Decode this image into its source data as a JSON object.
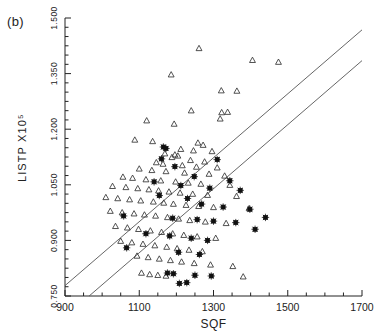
{
  "figure": {
    "panel_label": "(b)"
  },
  "chart_data": {
    "type": "scatter",
    "title": "",
    "xlabel": "SQF",
    "ylabel": "LISTP X10⁵",
    "xlim": [
      900,
      1700
    ],
    "ylim": [
      0.75,
      1.5
    ],
    "xticks": [
      900,
      1100,
      1300,
      1500,
      1700
    ],
    "xtick_labels": [
      "900",
      "1100",
      "1300",
      "1500",
      "1700"
    ],
    "xtick_minor_step": 50,
    "yticks": [
      0.75,
      0.9,
      1.05,
      1.2,
      1.35,
      1.5
    ],
    "ytick_labels": [
      "0.750",
      "0.900",
      "1.050",
      "1.200",
      "1.350",
      "1.500"
    ],
    "ytick_minor_step": 0.025,
    "grid": false,
    "legend": null,
    "series": [
      {
        "name": "triangle",
        "marker": "open-triangle",
        "color": "#333333",
        "points": [
          [
            1261,
            1.418
          ],
          [
            1405,
            1.386
          ],
          [
            1475,
            1.381
          ],
          [
            1186,
            1.347
          ],
          [
            1321,
            1.304
          ],
          [
            1363,
            1.303
          ],
          [
            1240,
            1.25
          ],
          [
            1322,
            1.245
          ],
          [
            1338,
            1.246
          ],
          [
            1318,
            1.228
          ],
          [
            1120,
            1.223
          ],
          [
            1194,
            1.214
          ],
          [
            1088,
            1.171
          ],
          [
            1136,
            1.167
          ],
          [
            1258,
            1.163
          ],
          [
            1272,
            1.157
          ],
          [
            1212,
            1.146
          ],
          [
            1246,
            1.142
          ],
          [
            1296,
            1.14
          ],
          [
            1169,
            1.134
          ],
          [
            1196,
            1.131
          ],
          [
            1204,
            1.128
          ],
          [
            1188,
            1.124
          ],
          [
            1238,
            1.116
          ],
          [
            1276,
            1.112
          ],
          [
            1146,
            1.11
          ],
          [
            1164,
            1.106
          ],
          [
            1216,
            1.102
          ],
          [
            1254,
            1.098
          ],
          [
            1310,
            1.096
          ],
          [
            1100,
            1.093
          ],
          [
            1134,
            1.089
          ],
          [
            1172,
            1.086
          ],
          [
            1222,
            1.082
          ],
          [
            1288,
            1.079
          ],
          [
            1330,
            1.074
          ],
          [
            1056,
            1.071
          ],
          [
            1082,
            1.068
          ],
          [
            1118,
            1.064
          ],
          [
            1158,
            1.061
          ],
          [
            1198,
            1.058
          ],
          [
            1232,
            1.055
          ],
          [
            1266,
            1.052
          ],
          [
            1344,
            1.049
          ],
          [
            1028,
            1.046
          ],
          [
            1064,
            1.043
          ],
          [
            1096,
            1.04
          ],
          [
            1126,
            1.037
          ],
          [
            1152,
            1.034
          ],
          [
            1180,
            1.031
          ],
          [
            1210,
            1.028
          ],
          [
            1244,
            1.025
          ],
          [
            1284,
            1.022
          ],
          [
            1362,
            1.019
          ],
          [
            1010,
            1.016
          ],
          [
            1042,
            1.013
          ],
          [
            1074,
            1.01
          ],
          [
            1104,
            1.007
          ],
          [
            1138,
            1.004
          ],
          [
            1166,
            1.001
          ],
          [
            1192,
            0.998
          ],
          [
            1226,
            0.995
          ],
          [
            1260,
            0.992
          ],
          [
            1300,
            0.989
          ],
          [
            1396,
            0.986
          ],
          [
            1022,
            0.979
          ],
          [
            1054,
            0.975
          ],
          [
            1086,
            0.972
          ],
          [
            1114,
            0.969
          ],
          [
            1144,
            0.966
          ],
          [
            1176,
            0.962
          ],
          [
            1206,
            0.958
          ],
          [
            1236,
            0.954
          ],
          [
            1278,
            0.95
          ],
          [
            1334,
            0.946
          ],
          [
            1036,
            0.938
          ],
          [
            1068,
            0.934
          ],
          [
            1098,
            0.93
          ],
          [
            1130,
            0.926
          ],
          [
            1160,
            0.922
          ],
          [
            1190,
            0.918
          ],
          [
            1220,
            0.914
          ],
          [
            1256,
            0.91
          ],
          [
            1306,
            0.906
          ],
          [
            1050,
            0.898
          ],
          [
            1080,
            0.894
          ],
          [
            1110,
            0.89
          ],
          [
            1142,
            0.886
          ],
          [
            1174,
            0.882
          ],
          [
            1202,
            0.878
          ],
          [
            1234,
            0.874
          ],
          [
            1270,
            0.87
          ],
          [
            1094,
            0.858
          ],
          [
            1124,
            0.854
          ],
          [
            1154,
            0.85
          ],
          [
            1184,
            0.846
          ],
          [
            1214,
            0.842
          ],
          [
            1248,
            0.838
          ],
          [
            1292,
            0.834
          ],
          [
            1352,
            0.83
          ],
          [
            1106,
            0.812
          ],
          [
            1128,
            0.808
          ],
          [
            1150,
            0.806
          ],
          [
            1172,
            0.804
          ],
          [
            1380,
            0.802
          ]
        ]
      },
      {
        "name": "star",
        "marker": "filled-star",
        "color": "#111111",
        "points": [
          [
            1165,
            1.152
          ],
          [
            1172,
            1.148
          ],
          [
            1160,
            1.12
          ],
          [
            1310,
            1.118
          ],
          [
            1196,
            1.099
          ],
          [
            1248,
            1.072
          ],
          [
            1344,
            1.061
          ],
          [
            1140,
            1.058
          ],
          [
            1212,
            1.048
          ],
          [
            1290,
            1.041
          ],
          [
            1372,
            1.035
          ],
          [
            1154,
            1.021
          ],
          [
            1230,
            1.013
          ],
          [
            1268,
            0.998
          ],
          [
            1326,
            0.99
          ],
          [
            1398,
            0.984
          ],
          [
            1058,
            0.966
          ],
          [
            1190,
            0.96
          ],
          [
            1256,
            0.956
          ],
          [
            1300,
            0.952
          ],
          [
            1360,
            0.948
          ],
          [
            1118,
            0.918
          ],
          [
            1182,
            0.912
          ],
          [
            1240,
            0.906
          ],
          [
            1284,
            0.9
          ],
          [
            1440,
            0.962
          ],
          [
            1412,
            0.93
          ],
          [
            1066,
            0.88
          ],
          [
            1206,
            0.868
          ],
          [
            1262,
            0.862
          ],
          [
            1176,
            0.812
          ],
          [
            1192,
            0.81
          ],
          [
            1250,
            0.806
          ],
          [
            1294,
            0.804
          ],
          [
            1228,
            0.786
          ],
          [
            1208,
            0.784
          ]
        ]
      }
    ],
    "fit_lines": [
      {
        "name": "upper-fit",
        "x0": 900,
        "y0": 0.778,
        "x1": 1700,
        "y1": 1.468
      },
      {
        "name": "lower-fit",
        "x0": 965,
        "y0": 0.75,
        "x1": 1700,
        "y1": 1.385
      }
    ]
  }
}
